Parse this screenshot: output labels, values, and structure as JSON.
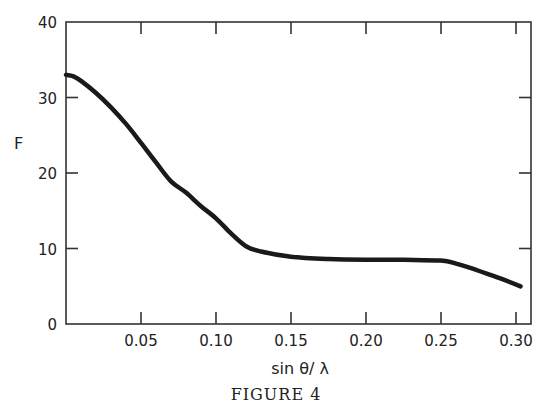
{
  "chart_data": {
    "type": "line",
    "title": "",
    "caption": "FIGURE 4",
    "xlabel": "sin θ / λ",
    "ylabel": "F",
    "xlim": [
      0.0,
      0.31
    ],
    "ylim": [
      0,
      40
    ],
    "grid": false,
    "legend": null,
    "x_ticks": [
      0.05,
      0.1,
      0.15,
      0.2,
      0.25,
      0.3
    ],
    "x_tick_labels": [
      "0.05",
      "0.10",
      "0.15",
      "0.20",
      "0.25",
      "0.30"
    ],
    "y_ticks": [
      0,
      10,
      20,
      30,
      40
    ],
    "y_tick_labels": [
      "0",
      "10",
      "20",
      "30",
      "40"
    ],
    "series": [
      {
        "name": "F",
        "color": "#1a1a1a",
        "x": [
          0.0,
          0.005,
          0.01,
          0.02,
          0.03,
          0.04,
          0.05,
          0.06,
          0.07,
          0.08,
          0.09,
          0.1,
          0.11,
          0.12,
          0.13,
          0.15,
          0.175,
          0.2,
          0.225,
          0.25,
          0.26,
          0.27,
          0.28,
          0.29,
          0.303
        ],
        "y": [
          33.0,
          32.8,
          32.2,
          30.6,
          28.7,
          26.5,
          24.0,
          21.4,
          18.9,
          17.4,
          15.6,
          14.0,
          12.0,
          10.3,
          9.6,
          8.9,
          8.6,
          8.5,
          8.5,
          8.4,
          8.0,
          7.4,
          6.7,
          6.0,
          5.0
        ]
      }
    ]
  },
  "labels": {
    "ylabel": "F",
    "xlabel": "sin θ/ λ",
    "caption": "FIGURE 4"
  }
}
